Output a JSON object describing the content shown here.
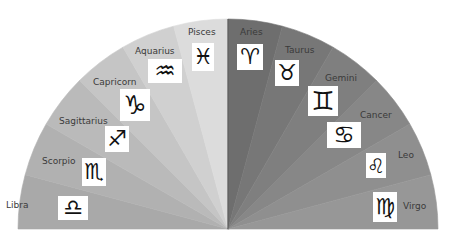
{
  "diagram": {
    "title": "",
    "center": {
      "x": 228,
      "y": 229
    },
    "radius": 210,
    "signs": [
      {
        "name": "Libra",
        "glyph": "♎",
        "icon": "libra-icon",
        "fill": "#a9a9a9",
        "label": {
          "x": 6,
          "y": 201
        },
        "symbol": {
          "x": 58,
          "y": 196,
          "w": 30,
          "h": 24,
          "size": 22
        }
      },
      {
        "name": "Scorpio",
        "glyph": "♏",
        "icon": "scorpio-icon",
        "fill": "#b1b1b1",
        "label": {
          "x": 42,
          "y": 157
        },
        "symbol": {
          "x": 82,
          "y": 158,
          "w": 24,
          "h": 28,
          "size": 22
        }
      },
      {
        "name": "Sagittarius",
        "glyph": "♐",
        "icon": "sagittarius-icon",
        "fill": "#bababa",
        "label": {
          "x": 59,
          "y": 117
        },
        "symbol": {
          "x": 105,
          "y": 126,
          "w": 24,
          "h": 26,
          "size": 22
        }
      },
      {
        "name": "Capricorn",
        "glyph": "♑",
        "icon": "capricorn-icon",
        "fill": "#c5c5c5",
        "label": {
          "x": 93,
          "y": 78
        },
        "symbol": {
          "x": 120,
          "y": 89,
          "w": 30,
          "h": 32,
          "size": 26
        }
      },
      {
        "name": "Aquarius",
        "glyph": "♒",
        "icon": "aquarius-icon",
        "fill": "#d0d0d0",
        "label": {
          "x": 135,
          "y": 47
        },
        "symbol": {
          "x": 148,
          "y": 59,
          "w": 34,
          "h": 24,
          "size": 24
        }
      },
      {
        "name": "Pisces",
        "glyph": "♓",
        "icon": "pisces-icon",
        "fill": "#dcdcdc",
        "label": {
          "x": 188,
          "y": 28
        },
        "symbol": {
          "x": 192,
          "y": 43,
          "w": 22,
          "h": 28,
          "size": 22
        }
      },
      {
        "name": "Aries",
        "glyph": "♈",
        "icon": "aries-icon",
        "fill": "#6e6e6e",
        "label": {
          "x": 240,
          "y": 28
        },
        "symbol": {
          "x": 237,
          "y": 44,
          "w": 26,
          "h": 26,
          "size": 22
        }
      },
      {
        "name": "Taurus",
        "glyph": "♉",
        "icon": "taurus-icon",
        "fill": "#777777",
        "label": {
          "x": 285,
          "y": 46
        },
        "symbol": {
          "x": 275,
          "y": 60,
          "w": 24,
          "h": 26,
          "size": 22
        }
      },
      {
        "name": "Gemini",
        "glyph": "♊",
        "icon": "gemini-icon",
        "fill": "#7f7f7f",
        "label": {
          "x": 325,
          "y": 74
        },
        "symbol": {
          "x": 308,
          "y": 86,
          "w": 30,
          "h": 30,
          "size": 26
        }
      },
      {
        "name": "Cancer",
        "glyph": "♋",
        "icon": "cancer-icon",
        "fill": "#878787",
        "label": {
          "x": 360,
          "y": 111
        },
        "symbol": {
          "x": 327,
          "y": 122,
          "w": 34,
          "h": 26,
          "size": 24
        }
      },
      {
        "name": "Leo",
        "glyph": "♌",
        "icon": "leo-icon",
        "fill": "#8f8f8f",
        "label": {
          "x": 398,
          "y": 151
        },
        "symbol": {
          "x": 366,
          "y": 153,
          "w": 20,
          "h": 25,
          "size": 20
        }
      },
      {
        "name": "Virgo",
        "glyph": "♍",
        "icon": "virgo-icon",
        "fill": "#979797",
        "label": {
          "x": 403,
          "y": 202
        },
        "symbol": {
          "x": 373,
          "y": 192,
          "w": 24,
          "h": 30,
          "size": 22
        }
      }
    ]
  }
}
